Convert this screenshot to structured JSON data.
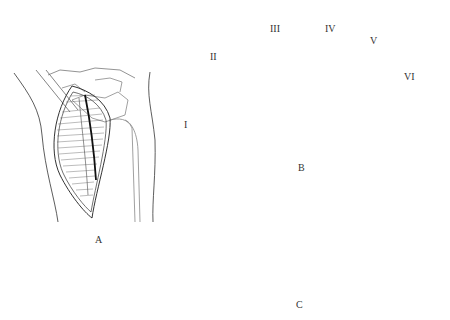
{
  "figure": {
    "panels": [
      {
        "id": "A",
        "label": "A",
        "description": "Dorsal view of wrist with longitudinal incision exposing extensor tendons"
      },
      {
        "id": "B",
        "label": "B",
        "description": "Cross-section of distal forearm showing six dorsal extensor compartments"
      },
      {
        "id": "C",
        "label": "C",
        "description": "Cross-section with retracted tendons and instrument inserted"
      }
    ],
    "compartments": [
      {
        "label": "I"
      },
      {
        "label": "II"
      },
      {
        "label": "III"
      },
      {
        "label": "IV"
      },
      {
        "label": "V"
      },
      {
        "label": "VI"
      }
    ],
    "colors": {
      "line": "#333333",
      "sheath_fill": "#d9d9d9",
      "bone_stipple": "#8a8a8a",
      "background": "#ffffff"
    }
  }
}
